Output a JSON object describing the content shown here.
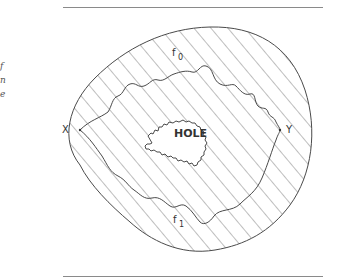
{
  "figure": {
    "labels": {
      "hole": "HOLE",
      "point_x": "X",
      "point_y": "Y",
      "path_f0_base": "f",
      "path_f0_sub": "0",
      "path_f1_base": "f",
      "path_f1_sub": "1"
    },
    "colors": {
      "stroke": "#4a4a4a",
      "hatch": "#6e6e6e",
      "rule": "#8a8a8a",
      "background": "#ffffff"
    }
  },
  "margin_fragments": [
    "f",
    "n",
    "e"
  ]
}
